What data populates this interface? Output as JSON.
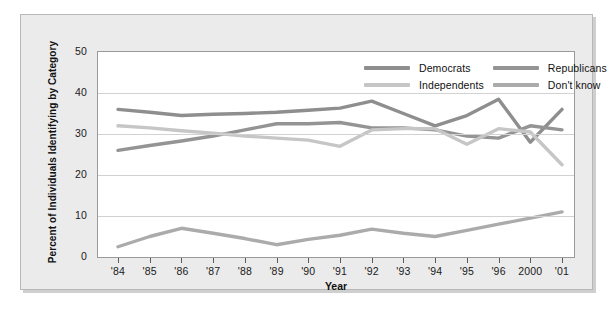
{
  "chart_data": {
    "type": "line",
    "title": "",
    "xlabel": "Year",
    "ylabel": "Percent of Individuals Identifying by Category",
    "categories": [
      "'84",
      "'85",
      "'86",
      "'87",
      "'88",
      "'89",
      "'90",
      "'91",
      "'92",
      "'93",
      "'94",
      "'95",
      "'96",
      "2000",
      "'01"
    ],
    "xlim": [
      0,
      14
    ],
    "ylim": [
      0,
      50
    ],
    "yticks": [
      0,
      10,
      20,
      30,
      40,
      50
    ],
    "grid": true,
    "legend_position": "top-right",
    "series": [
      {
        "name": "Democrats",
        "color": "#8e8e8e",
        "values": [
          36.0,
          35.3,
          34.5,
          34.8,
          35.0,
          35.3,
          35.8,
          36.3,
          38.0,
          35.0,
          32.0,
          34.5,
          38.5,
          28.0,
          36.0
        ]
      },
      {
        "name": "Republicans",
        "color": "#949494",
        "values": [
          26.0,
          27.2,
          28.3,
          29.5,
          31.0,
          32.5,
          32.5,
          32.8,
          31.5,
          31.5,
          31.0,
          29.5,
          29.0,
          32.0,
          31.0
        ]
      },
      {
        "name": "Independents",
        "color": "#c6c6c6",
        "values": [
          32.0,
          31.5,
          30.8,
          30.2,
          29.5,
          29.0,
          28.5,
          27.0,
          31.0,
          31.3,
          31.3,
          27.5,
          31.3,
          30.5,
          22.5
        ]
      },
      {
        "name": "Don't know",
        "color": "#ababab",
        "values": [
          2.5,
          5.0,
          7.0,
          5.8,
          4.5,
          3.0,
          4.3,
          5.3,
          6.8,
          5.8,
          5.0,
          6.5,
          8.0,
          9.5,
          11.0
        ]
      }
    ]
  },
  "legend": {
    "items": [
      {
        "label": "Democrats",
        "icon": "line-swatch-icon"
      },
      {
        "label": "Republicans",
        "icon": "line-swatch-icon"
      },
      {
        "label": "Independents",
        "icon": "line-swatch-icon"
      },
      {
        "label": "Don't know",
        "icon": "line-swatch-icon"
      }
    ]
  },
  "colors": {
    "panel_background": "#ebebeb",
    "plot_background": "#ffffff",
    "gridline": "#d2d2d2",
    "axis": "#9a9a9a",
    "text": "#1a1a1a"
  }
}
